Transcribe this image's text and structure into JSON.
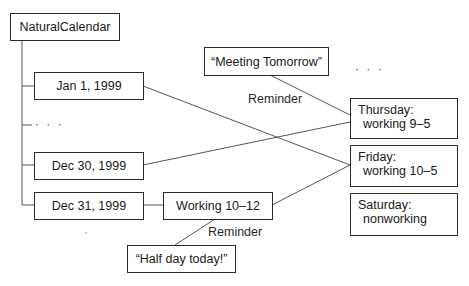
{
  "root": {
    "label": "NaturalCalendar"
  },
  "dates": [
    {
      "label": "Jan 1, 1999"
    },
    {
      "label": "Dec 30, 1999"
    },
    {
      "label": "Dec 31, 1999"
    }
  ],
  "date_ellipsis": "· · ·",
  "override": {
    "label": "Working 10–12"
  },
  "reminders": [
    {
      "note": "“Meeting Tomorrow”",
      "relation": "Reminder"
    },
    {
      "note": "“Half day today!”",
      "relation": "Reminder"
    }
  ],
  "weekdays": [
    {
      "line1": "Thursday:",
      "line2": "working 9–5"
    },
    {
      "line1": "Friday:",
      "line2": "working 10–5"
    },
    {
      "line1": "Saturday:",
      "line2": "nonworking"
    }
  ],
  "weekday_ellipsis": "· · ·",
  "colors": {
    "line": "#555555",
    "border": "#2a2a2a",
    "text": "#1a1a1a"
  }
}
